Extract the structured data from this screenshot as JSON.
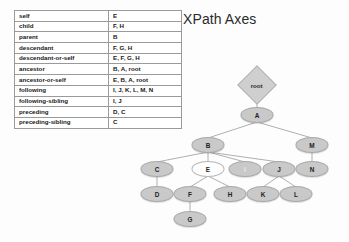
{
  "title": "XPath Axes",
  "table": {
    "rows": [
      {
        "axis": "self",
        "nodes": "E"
      },
      {
        "axis": "child",
        "nodes": "F, H"
      },
      {
        "axis": "parent",
        "nodes": "B"
      },
      {
        "axis": "descendant",
        "nodes": "F, G, H"
      },
      {
        "axis": "descendant-or-self",
        "nodes": "E, F, G, H"
      },
      {
        "axis": "ancestor",
        "nodes": "B, A, root"
      },
      {
        "axis": "ancestor-or-self",
        "nodes": "E, B, A, root"
      },
      {
        "axis": "following",
        "nodes": "I, J, K, L, M, N"
      },
      {
        "axis": "following-sibling",
        "nodes": "I, J"
      },
      {
        "axis": "preceding",
        "nodes": "D, C"
      },
      {
        "axis": "preceding-sibling",
        "nodes": "C"
      }
    ]
  },
  "tree": {
    "nodes": [
      {
        "id": "root",
        "label": "root",
        "shape": "diamond",
        "fill": "grey",
        "x": 257,
        "y": 85
      },
      {
        "id": "A",
        "label": "A",
        "shape": "ellipse",
        "fill": "grey",
        "x": 257,
        "y": 115
      },
      {
        "id": "B",
        "label": "B",
        "shape": "ellipse",
        "fill": "grey",
        "x": 208,
        "y": 145
      },
      {
        "id": "M",
        "label": "M",
        "shape": "ellipse",
        "fill": "grey",
        "x": 312,
        "y": 145
      },
      {
        "id": "C",
        "label": "C",
        "shape": "ellipse",
        "fill": "grey",
        "x": 157,
        "y": 169
      },
      {
        "id": "E",
        "label": "E",
        "shape": "ellipse",
        "fill": "white",
        "x": 208,
        "y": 169
      },
      {
        "id": "I",
        "label": "I",
        "shape": "ellipse",
        "fill": "faded",
        "x": 245,
        "y": 169
      },
      {
        "id": "J",
        "label": "J",
        "shape": "ellipse",
        "fill": "grey",
        "x": 279,
        "y": 169
      },
      {
        "id": "N",
        "label": "N",
        "shape": "ellipse",
        "fill": "grey",
        "x": 312,
        "y": 169
      },
      {
        "id": "D",
        "label": "D",
        "shape": "ellipse",
        "fill": "grey",
        "x": 157,
        "y": 194
      },
      {
        "id": "F",
        "label": "F",
        "shape": "ellipse",
        "fill": "grey",
        "x": 190,
        "y": 194
      },
      {
        "id": "H",
        "label": "H",
        "shape": "ellipse",
        "fill": "grey",
        "x": 230,
        "y": 194
      },
      {
        "id": "K",
        "label": "K",
        "shape": "ellipse",
        "fill": "grey",
        "x": 263,
        "y": 194
      },
      {
        "id": "L",
        "label": "L",
        "shape": "ellipse",
        "fill": "grey",
        "x": 296,
        "y": 194
      },
      {
        "id": "G",
        "label": "G",
        "shape": "ellipse",
        "fill": "grey",
        "x": 190,
        "y": 219
      }
    ],
    "edges": [
      {
        "from": "root",
        "to": "A"
      },
      {
        "from": "A",
        "to": "B"
      },
      {
        "from": "A",
        "to": "M"
      },
      {
        "from": "B",
        "to": "C"
      },
      {
        "from": "B",
        "to": "E"
      },
      {
        "from": "B",
        "to": "I"
      },
      {
        "from": "B",
        "to": "J"
      },
      {
        "from": "M",
        "to": "N"
      },
      {
        "from": "C",
        "to": "D"
      },
      {
        "from": "E",
        "to": "F"
      },
      {
        "from": "E",
        "to": "H"
      },
      {
        "from": "J",
        "to": "K"
      },
      {
        "from": "J",
        "to": "L"
      },
      {
        "from": "F",
        "to": "G"
      }
    ],
    "edge_color": "#a6a6a6"
  },
  "colors": {
    "node_fill": "#c9c9c9",
    "node_stroke": "#a8a8a8",
    "background": "#fdfdfd",
    "table_border": "#9a9a9a",
    "text": "#1d1d1d"
  }
}
